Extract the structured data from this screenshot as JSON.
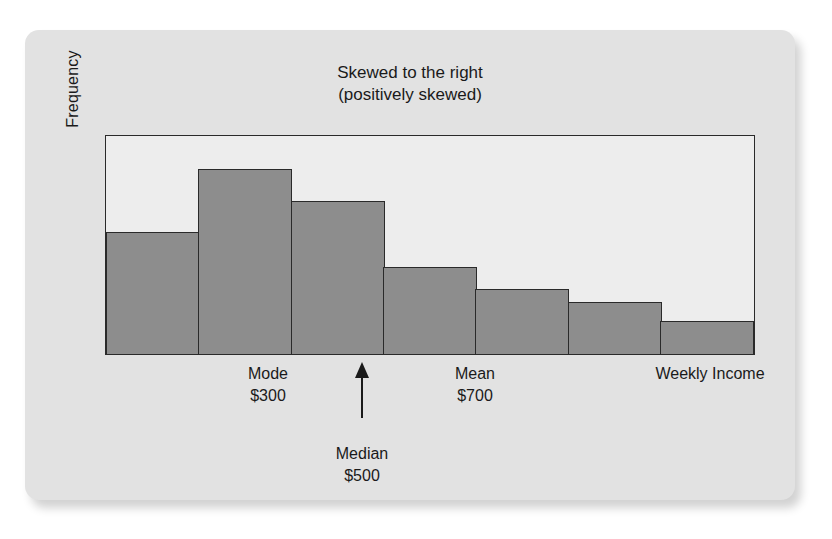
{
  "figure": {
    "title_line1": "Skewed to the right",
    "title_line2": "(positively skewed)",
    "ylabel": "Frequency",
    "xlabel": "Weekly Income",
    "colors": {
      "card_background": "#e2e2e2",
      "plot_background": "#ededed",
      "bar_fill": "#8d8d8d",
      "line": "#2a2a2a",
      "text": "#1a1a1a"
    }
  },
  "annotations": {
    "mode": {
      "label": "Mode",
      "value": "$300"
    },
    "median": {
      "label": "Median",
      "value": "$500",
      "marker": "up-arrow"
    },
    "mean": {
      "label": "Mean",
      "value": "$700"
    }
  },
  "chart_data": {
    "type": "bar",
    "title": "Skewed to the right (positively skewed)",
    "xlabel": "Weekly Income",
    "ylabel": "Frequency",
    "categories": [
      "1",
      "2",
      "3",
      "4",
      "5",
      "6",
      "7"
    ],
    "values": [
      56,
      85,
      70,
      40,
      30,
      24,
      15
    ],
    "ylim": [
      0,
      100
    ],
    "grid": false,
    "legend": false,
    "bar_gap": 0,
    "annotations": [
      {
        "text": "Mode $300",
        "at_category": "2",
        "position": "below-axis"
      },
      {
        "text": "Median $500",
        "at_category": "3",
        "position": "below-axis",
        "marker": "up-arrow"
      },
      {
        "text": "Mean $700",
        "at_category": "4",
        "position": "below-axis"
      }
    ]
  }
}
